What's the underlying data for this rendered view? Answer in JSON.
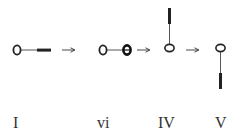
{
  "diagram": {
    "type": "progression",
    "stages": [
      {
        "id": "I",
        "label": "I",
        "shape": "circle with horizontal line to thick bar (right)"
      },
      {
        "id": "vi",
        "label": "vi",
        "shape": "two circles joined by horizontal line (second bold)"
      },
      {
        "id": "IV",
        "label": "IV",
        "shape": "ellipse with vertical line up to thick bar"
      },
      {
        "id": "V",
        "label": "V",
        "shape": "ellipse with vertical line down to thick bar"
      }
    ],
    "arrows": [
      {
        "from": "I",
        "to": "vi",
        "glyph": "→"
      },
      {
        "from": "vi",
        "to": "IV",
        "glyph": "→"
      },
      {
        "from": "IV",
        "to": "V",
        "glyph": "→"
      }
    ],
    "colors": {
      "stroke": "#222222",
      "background": "#ffffff"
    }
  }
}
